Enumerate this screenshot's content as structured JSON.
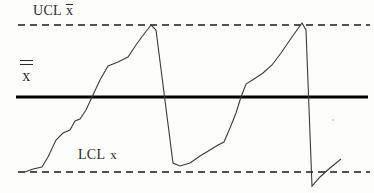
{
  "chart_data": {
    "type": "line",
    "title": "",
    "xlabel": "",
    "ylabel": "",
    "grid": false,
    "legend_position": "none",
    "xlim": [
      0,
      374
    ],
    "ylim_pixels": [
      193,
      0
    ],
    "annotations": [
      {
        "name": "ucl-label",
        "text": "UCL x̄",
        "base_text": "UCL",
        "symbol": "x",
        "bar_count": 1,
        "x": 33,
        "y": 10
      },
      {
        "name": "center-label",
        "text": "x̄̄",
        "base_text": "",
        "symbol": "x",
        "bar_count": 2,
        "x": 26,
        "y": 72
      },
      {
        "name": "lcl-label",
        "text": "LCL x",
        "base_text": "LCL",
        "symbol": "x",
        "bar_count": 0,
        "x": 78,
        "y": 155
      }
    ],
    "control_limits": [
      {
        "name": "upper-control-limit",
        "label": "UCL x̄",
        "style": "dashed",
        "y": 25,
        "x_start": 18,
        "x_end": 370,
        "color": "#1a1a1a",
        "width": 1.6
      },
      {
        "name": "center-line",
        "label": "x̄̄",
        "style": "solid",
        "y": 97,
        "x_start": 16,
        "x_end": 368,
        "color": "#000000",
        "width": 3.2
      },
      {
        "name": "lower-control-limit",
        "label": "LCL x",
        "style": "dashed",
        "y": 172,
        "x_start": 18,
        "x_end": 370,
        "color": "#1a1a1a",
        "width": 1.6
      }
    ],
    "series": [
      {
        "name": "process-measurement",
        "color": "#3a3a3a",
        "width": 1.1,
        "points": [
          [
            25,
            172
          ],
          [
            33,
            169
          ],
          [
            42,
            167
          ],
          [
            48,
            157
          ],
          [
            56,
            140
          ],
          [
            63,
            133
          ],
          [
            70,
            130
          ],
          [
            75,
            121
          ],
          [
            80,
            119
          ],
          [
            86,
            110
          ],
          [
            92,
            97
          ],
          [
            100,
            80
          ],
          [
            108,
            66
          ],
          [
            118,
            62
          ],
          [
            128,
            57
          ],
          [
            136,
            45
          ],
          [
            144,
            34
          ],
          [
            151,
            25
          ],
          [
            156,
            30
          ],
          [
            173,
            163
          ],
          [
            180,
            166
          ],
          [
            190,
            163
          ],
          [
            200,
            156
          ],
          [
            210,
            150
          ],
          [
            218,
            145
          ],
          [
            224,
            142
          ],
          [
            230,
            128
          ],
          [
            236,
            113
          ],
          [
            241,
            97
          ],
          [
            246,
            84
          ],
          [
            254,
            79
          ],
          [
            263,
            73
          ],
          [
            272,
            65
          ],
          [
            281,
            53
          ],
          [
            292,
            37
          ],
          [
            302,
            23
          ],
          [
            306,
            30
          ],
          [
            312,
            186
          ],
          [
            320,
            177
          ],
          [
            330,
            168
          ],
          [
            341,
            159
          ]
        ]
      }
    ]
  }
}
